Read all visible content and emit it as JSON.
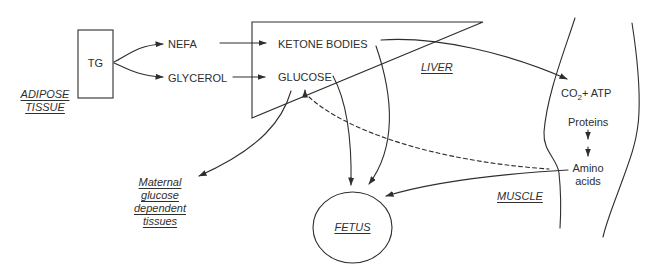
{
  "diagram": {
    "colors": {
      "ink": "#2e2e2e",
      "background": "#ffffff"
    },
    "adipose_tissue": {
      "box_label": "TG",
      "label_lines": [
        "ADIPOSE",
        "TISSUE"
      ]
    },
    "metabolites": {
      "nefa": "NEFA",
      "glycerol": "GLYCEROL",
      "ketone_bodies": "KETONE BODIES",
      "glucose": "GLUCOSE"
    },
    "liver": {
      "label": "LIVER"
    },
    "muscle": {
      "label": "MUSCLE",
      "co2_atp": {
        "base": "CO",
        "subscript": "2",
        "suffix": "+ ATP"
      },
      "proteins": "Proteins",
      "amino_acids_lines": [
        "Amino",
        "acids"
      ]
    },
    "fetus": {
      "label": "FETUS"
    },
    "maternal_tissues": {
      "label_lines": [
        "Maternal",
        "glucose",
        "dependent",
        "tissues"
      ]
    },
    "connections": [
      {
        "from": "TG",
        "to": "NEFA",
        "style": "solid-arrow"
      },
      {
        "from": "TG",
        "to": "GLYCEROL",
        "style": "solid-arrow"
      },
      {
        "from": "NEFA",
        "to": "KETONE BODIES",
        "style": "solid-arrow"
      },
      {
        "from": "GLYCEROL",
        "to": "GLUCOSE",
        "style": "solid-arrow"
      },
      {
        "from": "KETONE BODIES",
        "to": "CO2+ ATP (muscle)",
        "style": "solid-arrow"
      },
      {
        "from": "KETONE BODIES",
        "to": "FETUS",
        "style": "solid-arrow"
      },
      {
        "from": "GLUCOSE",
        "to": "FETUS",
        "style": "solid-arrow"
      },
      {
        "from": "GLUCOSE",
        "to": "Maternal glucose dependent tissues",
        "style": "solid-arrow"
      },
      {
        "from": "Amino acids",
        "to": "FETUS",
        "style": "solid-arrow"
      },
      {
        "from": "Amino acids",
        "to": "GLUCOSE",
        "style": "dashed-arrow"
      },
      {
        "from": "Proteins",
        "to": "Amino acids",
        "style": "double-solid-arrow"
      }
    ]
  }
}
